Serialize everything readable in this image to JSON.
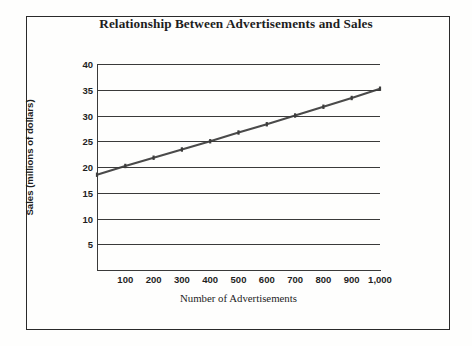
{
  "figure": {
    "title": "Relationship Between Advertisements and Sales",
    "border_color": "#2a2a2a",
    "background_color": "#fdfdfc"
  },
  "chart_data": {
    "type": "line",
    "title": "Relationship Between Advertisements and Sales",
    "xlabel": "Number of Advertisements",
    "ylabel": "Sales (millions of dollars)",
    "xlim": [
      0,
      1000
    ],
    "ylim": [
      0,
      40
    ],
    "grid": "horizontal",
    "legend": "none",
    "line_color": "#4a4a4a",
    "marker": "tick",
    "x_tick_labels": [
      "100",
      "200",
      "300",
      "400",
      "500",
      "600",
      "700",
      "800",
      "900",
      "1,000"
    ],
    "x_ticks": [
      100,
      200,
      300,
      400,
      500,
      600,
      700,
      800,
      900,
      1000
    ],
    "y_tick_labels": [
      "5",
      "10",
      "15",
      "20",
      "25",
      "30",
      "35",
      "40"
    ],
    "y_ticks": [
      5,
      10,
      15,
      20,
      25,
      30,
      35,
      40
    ],
    "series": [
      {
        "name": "Sales",
        "x": [
          0,
          100,
          200,
          300,
          400,
          500,
          600,
          700,
          800,
          900,
          1000
        ],
        "values": [
          18.5,
          20.2,
          21.8,
          23.4,
          25.0,
          26.7,
          28.3,
          30.0,
          31.7,
          33.4,
          35.2
        ]
      }
    ]
  }
}
